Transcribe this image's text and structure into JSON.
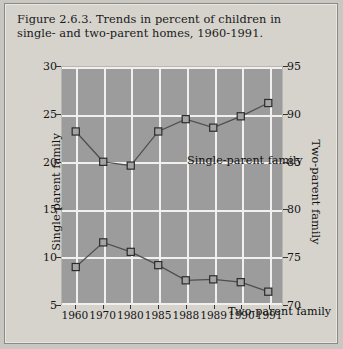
{
  "figure": {
    "title": "Figure 2.6.3. Trends in percent of children in single- and two-parent homes, 1960-1991."
  },
  "chart_data": {
    "type": "line",
    "title": "Figure 2.6.3. Trends in percent of children in single- and two-parent homes, 1960-1991.",
    "xlabel": "",
    "ylabel": "Single-parent family",
    "y2label": "Two-parent family",
    "categories": [
      "1960",
      "1970",
      "1980",
      "1985",
      "1988",
      "1989",
      "1990",
      "1991"
    ],
    "ylim": [
      5,
      30
    ],
    "y2lim": [
      70,
      95
    ],
    "yticks": [
      5,
      10,
      15,
      20,
      25,
      30
    ],
    "y2ticks": [
      70,
      75,
      80,
      85,
      90,
      95
    ],
    "grid": true,
    "legend": "inline-annotations",
    "series": [
      {
        "name": "Single-parent family",
        "axis": "left",
        "values": [
          23.2,
          20.0,
          19.6,
          23.2,
          24.5,
          23.6,
          24.8,
          26.2
        ],
        "marker": "open-square"
      },
      {
        "name": "Two-parent family",
        "axis": "right",
        "values": [
          88.9,
          81.5,
          75.5,
          74.1,
          72.5,
          72.6,
          72.3,
          71.3
        ],
        "values_on_left_scale": [
          8.9,
          11.5,
          10.5,
          9.1,
          7.5,
          7.6,
          7.3,
          6.3
        ],
        "marker": "open-square"
      }
    ],
    "annotations": [
      {
        "text": "Single-parent family",
        "near": "top-center"
      },
      {
        "text": "Two-parent family",
        "near": "lower-right"
      }
    ]
  }
}
